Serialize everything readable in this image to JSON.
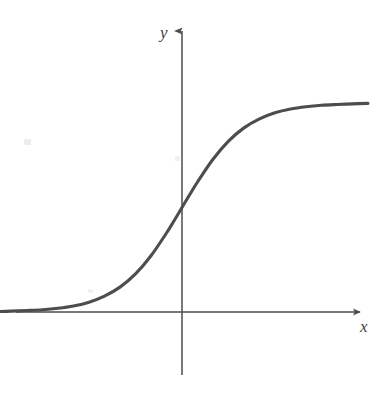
{
  "figure": {
    "kind": "line-plot",
    "background_color": "#ffffff",
    "ink_color": "#4d4d4d",
    "title": "",
    "caption": ""
  },
  "axes": {
    "x_axis": {
      "label": "x",
      "color": "#4d4d4d",
      "arrow": "right",
      "y_pixel": 312,
      "start_x_pixel": 16,
      "end_x_pixel": 362
    },
    "y_axis": {
      "label": "y",
      "color": "#4d4d4d",
      "arrow": "up",
      "x_pixel": 182,
      "start_y_pixel": 375,
      "end_y_pixel": 28
    },
    "origin": {
      "x_pixel": 182,
      "y_pixel": 312
    },
    "tick_labels": [],
    "gridlines": false
  },
  "chart_data": {
    "type": "line",
    "title": "",
    "xlabel": "x",
    "ylabel": "y",
    "grid": false,
    "legend": null,
    "annotations": [],
    "xlim": [
      -6,
      6
    ],
    "ylim": [
      -0.12,
      1.18
    ],
    "series": [
      {
        "name": "sigmoid",
        "color": "#4d4d4d",
        "x": [
          -6.0,
          -5.5,
          -5.0,
          -4.5,
          -4.0,
          -3.5,
          -3.0,
          -2.5,
          -2.0,
          -1.5,
          -1.0,
          -0.5,
          -0.25,
          0.0,
          0.25,
          0.5,
          1.0,
          1.5,
          2.0,
          2.5,
          3.0,
          3.5,
          4.0,
          4.5,
          5.0,
          5.5,
          6.0
        ],
        "y": [
          0.002,
          0.004,
          0.007,
          0.011,
          0.018,
          0.029,
          0.047,
          0.076,
          0.119,
          0.182,
          0.269,
          0.378,
          0.438,
          0.5,
          0.562,
          0.622,
          0.731,
          0.818,
          0.881,
          0.924,
          0.953,
          0.971,
          0.982,
          0.989,
          0.993,
          0.996,
          0.998
        ]
      }
    ],
    "asymptotes": [
      {
        "name": "lower-asymptote",
        "value": 0.0,
        "orientation": "horizontal"
      },
      {
        "name": "upper-asymptote",
        "value": 1.0,
        "orientation": "horizontal"
      }
    ]
  },
  "artifacts": {
    "specks": [
      {
        "name": "speck-left"
      },
      {
        "name": "speck-mid"
      },
      {
        "name": "speck-low"
      }
    ]
  }
}
